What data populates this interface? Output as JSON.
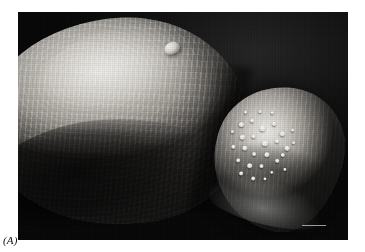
{
  "figure": {
    "panel_label": "(A)",
    "image_type": "scanning-electron-micrograph",
    "background_color": "#080808",
    "frame": {
      "left": 18,
      "top": 12,
      "width": 330,
      "height": 228
    },
    "features": {
      "body_mass": "ridged tegument body",
      "sucker": "ventral sucker / acetabulum",
      "papillae": "sensory papillae on sucker surface",
      "dorsal_papilla": "single dorsal papilla on body",
      "scale_bar": "scale bar"
    },
    "tones": {
      "highlight": "#efeeea",
      "midtone": "#a9a6a0",
      "shadow": "#2e2d2b",
      "background": "#080808",
      "label_color": "#111111"
    }
  }
}
